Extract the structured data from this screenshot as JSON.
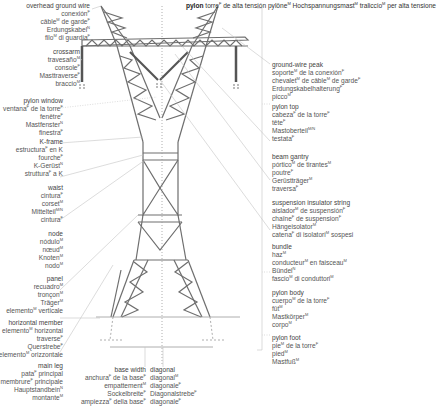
{
  "title": {
    "lines": [
      "pylon",
      "torre^F de alta tensión",
      "pylône^M",
      "Hochspannungsmast^M",
      "traliccio^M per alta tensione"
    ]
  },
  "left_labels": [
    {
      "id": "overhead-ground-wire",
      "lines": [
        "overhead ground wire",
        "conexión^F",
        "câble^M de garde^F",
        "Erdungskabel^N",
        "filo^M di guardia^F"
      ]
    },
    {
      "id": "crossarm",
      "lines": [
        "crossarm",
        "travesaño^M",
        "console^F",
        "Masttraverse^F",
        "braccio^M"
      ]
    },
    {
      "id": "pylon-window",
      "lines": [
        "pylon window",
        "ventana^F de la torre^F",
        "fenêtre^F",
        "Mastfenster^N",
        "finestra^F"
      ]
    },
    {
      "id": "k-frame",
      "lines": [
        "K-frame",
        "estructura^F en K",
        "fourche^F",
        "K-Gerüst^N",
        "struttura^F a K"
      ]
    },
    {
      "id": "waist",
      "lines": [
        "waist",
        "cintura^F",
        "corset^M",
        "Mittelteil^{M/N}",
        "cintura^F"
      ]
    },
    {
      "id": "node",
      "lines": [
        "node",
        "nódulo^M",
        "nœud^M",
        "Knoten^M",
        "nodo^M"
      ]
    },
    {
      "id": "panel",
      "lines": [
        "panel",
        "recuadro^M",
        "tronçon^M",
        "Träger^M",
        "elemento^M verticale"
      ]
    },
    {
      "id": "horizontal-member",
      "lines": [
        "horizontal member",
        "elemento^M horizontal",
        "traverse^F",
        "Querstrebe^F",
        "elemento^M orizzontale"
      ]
    },
    {
      "id": "main-leg",
      "lines": [
        "main leg",
        "pata^F principal",
        "membrure^F principale",
        "Hauptstandbein^N",
        "montante^M"
      ]
    }
  ],
  "bottom_labels": [
    {
      "id": "base-width",
      "lines": [
        "base width",
        "anchura^F de la base^F",
        "empattement^M",
        "Sockelbreite^F",
        "ampiezza^F della base^F"
      ]
    },
    {
      "id": "diagonal",
      "lines": [
        "diagonal",
        "diagonal^M",
        "diagonale^F",
        "Diagonalstrebe^F",
        "diagonale^F"
      ]
    }
  ],
  "right_labels": [
    {
      "id": "ground-wire-peak",
      "lines": [
        "ground-wire peak",
        "soporte^M de la conexión^F",
        "chevalet^M de câble^M de garde^F",
        "Erdungskabelhalterung^F",
        "picco^M"
      ]
    },
    {
      "id": "pylon-top",
      "lines": [
        "pylon top",
        "cabeza^F de la torre^F",
        "tête^F",
        "Mastoberteil^{M/N}",
        "testata^F"
      ]
    },
    {
      "id": "beam-gantry",
      "lines": [
        "beam gantry",
        "pórtico^M de tirantes^M",
        "poutre^F",
        "Gerüstträger^M",
        "traversa^F"
      ]
    },
    {
      "id": "suspension-insulator-string",
      "lines": [
        "suspension insulator string",
        "aislador^M de suspensión^F",
        "chaîne^F de suspension^F",
        "Hängeisolator^M",
        "catena^F di isolatori^M sospesi"
      ]
    },
    {
      "id": "bundle",
      "lines": [
        "bundle",
        "haz^M",
        "conducteur^M en faisceau^M",
        "Bündel^N",
        "fascio^M di conduttori^M"
      ]
    },
    {
      "id": "pylon-body",
      "lines": [
        "pylon body",
        "cuerpo^M de la torre^F",
        "fût^M",
        "Mastkörper^M",
        "corpo^M"
      ]
    },
    {
      "id": "pylon-foot",
      "lines": [
        "pylon foot",
        "pie^M de la torre^F",
        "pied^M",
        "Mastfuß^M",
        "piede^M"
      ]
    }
  ],
  "colors": {
    "structure": "#6b6b6b",
    "leader": "#bdbdbd",
    "text": "#555555"
  }
}
